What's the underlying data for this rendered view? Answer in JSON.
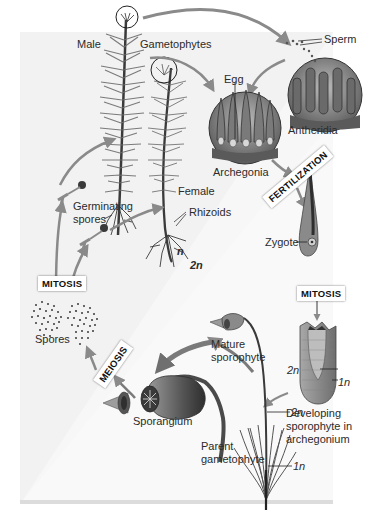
{
  "diagram": {
    "colors": {
      "background": "#ffffff",
      "haploid_panel": "#f2f2f2",
      "diploid_panel": "#f7f7f7",
      "arrow": "#8a8a8a",
      "plant_dark": "#3a3a3a",
      "plant_mid": "#7a7a7a",
      "text": "#2b2b2b"
    },
    "labels": {
      "male": "Male",
      "gametophytes": "Gametophytes",
      "sperm": "Sperm",
      "egg": "Egg",
      "antheridia": "Antheridia",
      "archegonia": "Archegonia",
      "female": "Female",
      "rhizoids": "Rhizoids",
      "germinating_spores_1": "Germinating",
      "germinating_spores_2": "spores",
      "n": "n",
      "two_n": "2n",
      "spores": "Spores",
      "zygote": "Zygote",
      "mature_sporophyte_1": "Mature",
      "mature_sporophyte_2": "sporophyte",
      "developing_1": "Developing",
      "developing_2": "sporophyte in",
      "developing_3": "archegonium",
      "dev_2n": "2n",
      "dev_1n": "1n",
      "sporangium": "Sporangium",
      "parent_gametophyte_1": "Parent",
      "parent_gametophyte_2": "gametophyte",
      "parent_2n": "2n",
      "parent_1n": "1n"
    },
    "process_boxes": {
      "fertilization": "FERTILIZATION",
      "mitosis_right": "MITOSIS",
      "mitosis_left": "MITOSIS",
      "meiosis": "MEIOSIS"
    }
  }
}
